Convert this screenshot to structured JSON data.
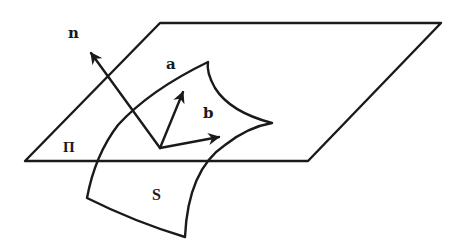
{
  "diagram": {
    "labels": {
      "normal": "n",
      "vector_a": "a",
      "vector_b": "b",
      "plane": "Π",
      "surface": "S"
    },
    "colors": {
      "stroke": "#1a1a1a",
      "background": "#ffffff"
    }
  }
}
